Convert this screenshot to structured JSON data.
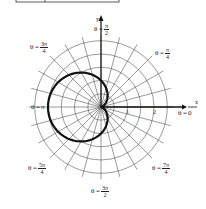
{
  "figure": {
    "equation_hint": "r = 1 - cos θ",
    "center": [
      101,
      107
    ],
    "unit_px": 26.5,
    "ring_count": 5,
    "ring_step": 0.5,
    "radial_step_deg": 15,
    "axes": {
      "x_label": "x",
      "y_label": "y"
    },
    "ticks": [
      {
        "value": "1"
      },
      {
        "value": "2"
      }
    ],
    "angle_labels": [
      {
        "id": "zero",
        "prefix": "θ = ",
        "text": "0"
      },
      {
        "id": "pi4",
        "prefix": "θ = ",
        "num": "π",
        "den": "4"
      },
      {
        "id": "pi2",
        "prefix": "θ = ",
        "num": "π",
        "den": "2"
      },
      {
        "id": "3pi4",
        "prefix": "θ = ",
        "num": "3π",
        "den": "4"
      },
      {
        "id": "pi",
        "prefix": "θ = ",
        "text": "π"
      },
      {
        "id": "5pi4",
        "prefix": "θ = ",
        "num": "5π",
        "den": "4"
      },
      {
        "id": "3pi2",
        "prefix": "θ = ",
        "num": "3π",
        "den": "2"
      },
      {
        "id": "7pi4",
        "prefix": "θ = ",
        "num": "7π",
        "den": "4"
      }
    ],
    "colors": {
      "grid": "#555555",
      "curve": "#111111",
      "axis": "#111111"
    }
  }
}
